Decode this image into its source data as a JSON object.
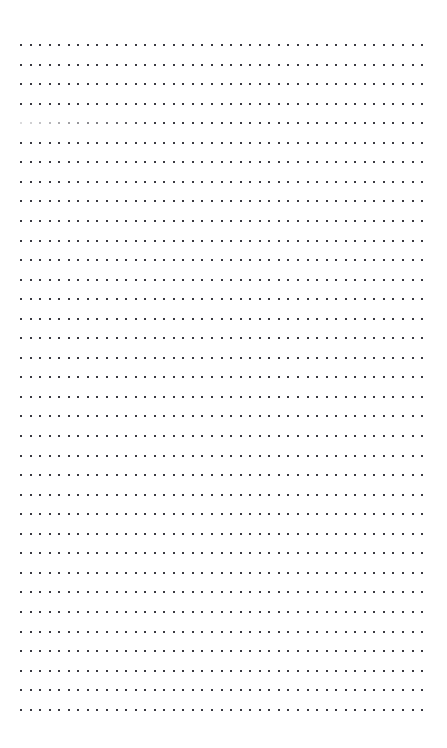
{
  "document": {
    "title": "Dot Grid Page",
    "type": "dot-grid",
    "page_label": "",
    "background_color": "#ffffff",
    "content_text": ""
  },
  "grid": {
    "dot_color": "#3a3a42",
    "dot_size_px": 2,
    "columns": 43,
    "rows": 35,
    "column_spacing_px": 9.55,
    "row_spacing_px": 19.55,
    "origin_x_px": 20,
    "origin_y_px": 45,
    "faded_rows": [
      4
    ],
    "faded_row_fade_columns": 14,
    "faded_min_opacity": 0.18
  },
  "margins": {
    "top_px": 45,
    "bottom_px": 38,
    "left_px": 20,
    "right_px": 24
  },
  "annotations": []
}
